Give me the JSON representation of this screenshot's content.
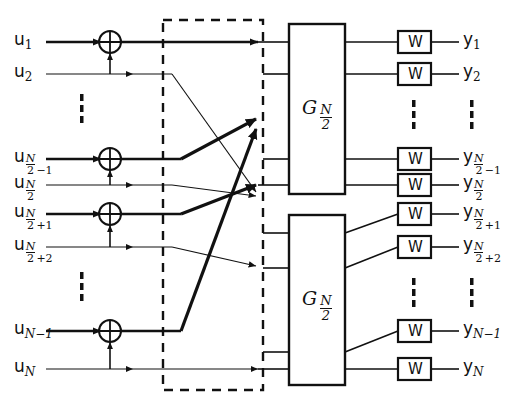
{
  "diagram": {
    "colors": {
      "line": "#111111",
      "background": "#ffffff",
      "dashed": "#111111"
    },
    "inputs": [
      {
        "name": "u1",
        "base": "u",
        "sub_main": "1",
        "sub_frac_num": "",
        "sub_frac_den": "",
        "sub_tail": "",
        "y": 42,
        "bold": true
      },
      {
        "name": "u2",
        "base": "u",
        "sub_main": "2",
        "sub_frac_num": "",
        "sub_frac_den": "",
        "sub_tail": "",
        "y": 74,
        "bold": false
      },
      {
        "name": "uN2m1",
        "base": "u",
        "sub_main": "",
        "sub_frac_num": "N",
        "sub_frac_den": "2",
        "sub_tail": "−1",
        "y": 159,
        "bold": true
      },
      {
        "name": "uN2",
        "base": "u",
        "sub_main": "",
        "sub_frac_num": "N",
        "sub_frac_den": "2",
        "sub_tail": "",
        "y": 185,
        "bold": false
      },
      {
        "name": "uN2p1",
        "base": "u",
        "sub_main": "",
        "sub_frac_num": "N",
        "sub_frac_den": "2",
        "sub_tail": "+1",
        "y": 214,
        "bold": true
      },
      {
        "name": "uN2p2",
        "base": "u",
        "sub_main": "",
        "sub_frac_num": "N",
        "sub_frac_den": "2",
        "sub_tail": "+2",
        "y": 247,
        "bold": false
      },
      {
        "name": "uNm1",
        "base": "u",
        "sub_main": "N−1",
        "sub_frac_num": "",
        "sub_frac_den": "",
        "sub_tail": "",
        "y": 331,
        "bold": true
      },
      {
        "name": "uN",
        "base": "u",
        "sub_main": "N",
        "sub_frac_num": "",
        "sub_frac_den": "",
        "sub_tail": "",
        "y": 369,
        "bold": false
      }
    ],
    "outputs": [
      {
        "name": "y1",
        "base": "y",
        "sub_main": "1",
        "sub_frac_num": "",
        "sub_frac_den": "",
        "sub_tail": "",
        "y": 42
      },
      {
        "name": "y2",
        "base": "y",
        "sub_main": "2",
        "sub_frac_num": "",
        "sub_frac_den": "",
        "sub_tail": "",
        "y": 74
      },
      {
        "name": "yN2m1",
        "base": "y",
        "sub_main": "",
        "sub_frac_num": "N",
        "sub_frac_den": "2",
        "sub_tail": "−1",
        "y": 159
      },
      {
        "name": "yN2",
        "base": "y",
        "sub_main": "",
        "sub_frac_num": "N",
        "sub_frac_den": "2",
        "sub_tail": "",
        "y": 185
      },
      {
        "name": "yN2p1",
        "base": "y",
        "sub_main": "",
        "sub_frac_num": "N",
        "sub_frac_den": "2",
        "sub_tail": "+1",
        "y": 214
      },
      {
        "name": "yN2p2",
        "base": "y",
        "sub_main": "",
        "sub_frac_num": "N",
        "sub_frac_den": "2",
        "sub_tail": "+2",
        "y": 247
      },
      {
        "name": "yNm1",
        "base": "y",
        "sub_main": "N−1",
        "sub_frac_num": "",
        "sub_frac_den": "",
        "sub_tail": "",
        "y": 331
      },
      {
        "name": "yN",
        "base": "y",
        "sub_main": "N",
        "sub_frac_num": "",
        "sub_frac_den": "",
        "sub_tail": "",
        "y": 369
      }
    ],
    "xor_gates": [
      {
        "name": "xor-u1",
        "cx": 110,
        "cy": 42
      },
      {
        "name": "xor-uN2m1",
        "cx": 110,
        "cy": 159
      },
      {
        "name": "xor-uN2p1",
        "cx": 110,
        "cy": 214
      },
      {
        "name": "xor-uNm1",
        "cx": 110,
        "cy": 331
      }
    ],
    "dashed_box": {
      "label": "permutation-block",
      "x": 163,
      "y": 20,
      "width": 100,
      "height": 370
    },
    "g_blocks": [
      {
        "name": "g-upper",
        "base": "G",
        "frac_num": "N",
        "frac_den": "2",
        "x": 289,
        "y": 24,
        "width": 56,
        "height": 170
      },
      {
        "name": "g-lower",
        "base": "G",
        "frac_num": "N",
        "frac_den": "2",
        "x": 289,
        "y": 215,
        "width": 56,
        "height": 170
      }
    ],
    "w_boxes": [
      {
        "name": "w-1",
        "label": "W",
        "y": 42
      },
      {
        "name": "w-2",
        "label": "W",
        "y": 74
      },
      {
        "name": "w-3",
        "label": "W",
        "y": 159
      },
      {
        "name": "w-4",
        "label": "W",
        "y": 185
      },
      {
        "name": "w-5",
        "label": "W",
        "y": 214
      },
      {
        "name": "w-6",
        "label": "W",
        "y": 247
      },
      {
        "name": "w-7",
        "label": "W",
        "y": 331
      },
      {
        "name": "w-8",
        "label": "W",
        "y": 369
      }
    ],
    "ellipses": [
      {
        "name": "ellipsis-input-top",
        "x": 82,
        "y": 100
      },
      {
        "name": "ellipsis-input-bottom",
        "x": 82,
        "y": 278
      },
      {
        "name": "ellipsis-output-top",
        "x": 451,
        "y": 110
      },
      {
        "name": "ellipsis-output-bottom",
        "x": 451,
        "y": 290
      },
      {
        "name": "ellipsis-w-top",
        "x": 413,
        "y": 110
      },
      {
        "name": "ellipsis-w-bottom",
        "x": 413,
        "y": 290
      }
    ]
  }
}
